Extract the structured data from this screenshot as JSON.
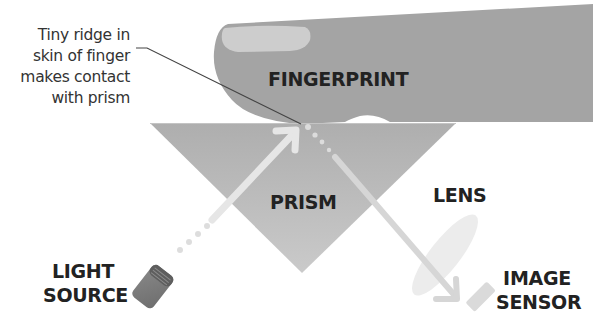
{
  "diagram": {
    "labels": {
      "fingerprint": "FINGERPRINT",
      "prism": "PRISM",
      "lens": "LENS",
      "light_source_line1": "LIGHT",
      "light_source_line2": "SOURCE",
      "image_sensor_line1": "IMAGE",
      "image_sensor_line2": "SENSOR"
    },
    "annotation": {
      "line1": "Tiny ridge in",
      "line2": "skin of finger",
      "line3": "makes contact",
      "line4": "with prism"
    },
    "colors": {
      "finger": "#a4a4a4",
      "nail": "#cfcfcf",
      "prism_top": "#b0b0b0",
      "prism_bottom": "#c8c8c8",
      "light_beam": "#e4e4e4",
      "lens": "#eeeeee",
      "sensor": "#dcdcdc",
      "light_source": "#7a7a7a",
      "text": "#222222",
      "leader_line": "#444444"
    }
  }
}
